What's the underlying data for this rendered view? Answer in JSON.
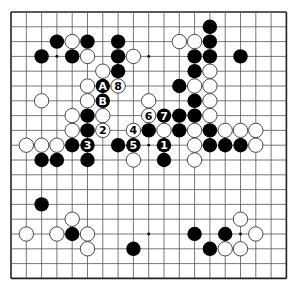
{
  "board": {
    "size": 19,
    "origin_x": 11,
    "origin_y": 12,
    "spacing_x": 15.3,
    "spacing_y": 14.8,
    "stone_radius": 7.2,
    "line_color": "#555555",
    "edge_color": "#222222",
    "background": "#ffffff",
    "black_color": "#000000",
    "white_fill": "#ffffff",
    "white_stroke": "#333333",
    "hoshi": [
      [
        3,
        3
      ],
      [
        9,
        3
      ],
      [
        15,
        3
      ],
      [
        3,
        9
      ],
      [
        9,
        9
      ],
      [
        15,
        9
      ],
      [
        3,
        15
      ],
      [
        9,
        15
      ],
      [
        15,
        15
      ]
    ]
  },
  "stones": [
    {
      "c": 13,
      "r": 1,
      "color": "black",
      "label": ""
    },
    {
      "c": 3,
      "r": 2,
      "color": "black",
      "label": ""
    },
    {
      "c": 4,
      "r": 2,
      "color": "white",
      "label": ""
    },
    {
      "c": 5,
      "r": 2,
      "color": "black",
      "label": ""
    },
    {
      "c": 7,
      "r": 2,
      "color": "black",
      "label": ""
    },
    {
      "c": 11,
      "r": 2,
      "color": "white",
      "label": ""
    },
    {
      "c": 12,
      "r": 2,
      "color": "white",
      "label": ""
    },
    {
      "c": 13,
      "r": 2,
      "color": "black",
      "label": ""
    },
    {
      "c": 2,
      "r": 3,
      "color": "black",
      "label": ""
    },
    {
      "c": 4,
      "r": 3,
      "color": "black",
      "label": ""
    },
    {
      "c": 5,
      "r": 3,
      "color": "white",
      "label": ""
    },
    {
      "c": 7,
      "r": 3,
      "color": "black",
      "label": ""
    },
    {
      "c": 8,
      "r": 3,
      "color": "white",
      "label": ""
    },
    {
      "c": 12,
      "r": 3,
      "color": "black",
      "label": ""
    },
    {
      "c": 13,
      "r": 3,
      "color": "black",
      "label": ""
    },
    {
      "c": 15,
      "r": 3,
      "color": "black",
      "label": ""
    },
    {
      "c": 6,
      "r": 4,
      "color": "white",
      "label": ""
    },
    {
      "c": 7,
      "r": 4,
      "color": "black",
      "label": ""
    },
    {
      "c": 12,
      "r": 4,
      "color": "black",
      "label": ""
    },
    {
      "c": 13,
      "r": 4,
      "color": "white",
      "label": ""
    },
    {
      "c": 5,
      "r": 5,
      "color": "white",
      "label": ""
    },
    {
      "c": 6,
      "r": 5,
      "color": "black",
      "label": "A"
    },
    {
      "c": 7,
      "r": 5,
      "color": "white",
      "label": "8"
    },
    {
      "c": 11,
      "r": 5,
      "color": "black",
      "label": ""
    },
    {
      "c": 12,
      "r": 5,
      "color": "white",
      "label": ""
    },
    {
      "c": 13,
      "r": 5,
      "color": "white",
      "label": ""
    },
    {
      "c": 2,
      "r": 6,
      "color": "white",
      "label": ""
    },
    {
      "c": 5,
      "r": 6,
      "color": "white",
      "label": ""
    },
    {
      "c": 6,
      "r": 6,
      "color": "black",
      "label": "B"
    },
    {
      "c": 9,
      "r": 6,
      "color": "white",
      "label": ""
    },
    {
      "c": 12,
      "r": 6,
      "color": "black",
      "label": ""
    },
    {
      "c": 13,
      "r": 6,
      "color": "white",
      "label": ""
    },
    {
      "c": 4,
      "r": 7,
      "color": "white",
      "label": ""
    },
    {
      "c": 5,
      "r": 7,
      "color": "black",
      "label": ""
    },
    {
      "c": 6,
      "r": 7,
      "color": "white",
      "label": ""
    },
    {
      "c": 9,
      "r": 7,
      "color": "white",
      "label": "6"
    },
    {
      "c": 10,
      "r": 7,
      "color": "black",
      "label": "7"
    },
    {
      "c": 11,
      "r": 7,
      "color": "black",
      "label": ""
    },
    {
      "c": 12,
      "r": 7,
      "color": "black",
      "label": ""
    },
    {
      "c": 13,
      "r": 7,
      "color": "white",
      "label": ""
    },
    {
      "c": 4,
      "r": 8,
      "color": "white",
      "label": ""
    },
    {
      "c": 5,
      "r": 8,
      "color": "black",
      "label": ""
    },
    {
      "c": 6,
      "r": 8,
      "color": "white",
      "label": "2"
    },
    {
      "c": 8,
      "r": 8,
      "color": "white",
      "label": "4"
    },
    {
      "c": 9,
      "r": 8,
      "color": "black",
      "label": ""
    },
    {
      "c": 10,
      "r": 8,
      "color": "white",
      "label": ""
    },
    {
      "c": 11,
      "r": 8,
      "color": "black",
      "label": ""
    },
    {
      "c": 12,
      "r": 8,
      "color": "white",
      "label": ""
    },
    {
      "c": 13,
      "r": 8,
      "color": "black",
      "label": ""
    },
    {
      "c": 14,
      "r": 8,
      "color": "white",
      "label": ""
    },
    {
      "c": 15,
      "r": 8,
      "color": "white",
      "label": ""
    },
    {
      "c": 16,
      "r": 8,
      "color": "white",
      "label": ""
    },
    {
      "c": 1,
      "r": 9,
      "color": "white",
      "label": ""
    },
    {
      "c": 2,
      "r": 9,
      "color": "white",
      "label": ""
    },
    {
      "c": 3,
      "r": 9,
      "color": "white",
      "label": ""
    },
    {
      "c": 4,
      "r": 9,
      "color": "black",
      "label": ""
    },
    {
      "c": 5,
      "r": 9,
      "color": "black",
      "label": "3"
    },
    {
      "c": 7,
      "r": 9,
      "color": "black",
      "label": ""
    },
    {
      "c": 8,
      "r": 9,
      "color": "black",
      "label": "5"
    },
    {
      "c": 10,
      "r": 9,
      "color": "black",
      "label": "1"
    },
    {
      "c": 12,
      "r": 9,
      "color": "white",
      "label": ""
    },
    {
      "c": 13,
      "r": 9,
      "color": "black",
      "label": ""
    },
    {
      "c": 14,
      "r": 9,
      "color": "black",
      "label": ""
    },
    {
      "c": 15,
      "r": 9,
      "color": "black",
      "label": ""
    },
    {
      "c": 16,
      "r": 9,
      "color": "white",
      "label": ""
    },
    {
      "c": 2,
      "r": 10,
      "color": "black",
      "label": ""
    },
    {
      "c": 3,
      "r": 10,
      "color": "black",
      "label": ""
    },
    {
      "c": 5,
      "r": 10,
      "color": "black",
      "label": ""
    },
    {
      "c": 8,
      "r": 10,
      "color": "white",
      "label": ""
    },
    {
      "c": 10,
      "r": 10,
      "color": "black",
      "label": ""
    },
    {
      "c": 12,
      "r": 10,
      "color": "white",
      "label": ""
    },
    {
      "c": 2,
      "r": 13,
      "color": "black",
      "label": ""
    },
    {
      "c": 4,
      "r": 14,
      "color": "white",
      "label": ""
    },
    {
      "c": 15,
      "r": 14,
      "color": "white",
      "label": ""
    },
    {
      "c": 1,
      "r": 15,
      "color": "white",
      "label": ""
    },
    {
      "c": 3,
      "r": 15,
      "color": "white",
      "label": ""
    },
    {
      "c": 4,
      "r": 15,
      "color": "black",
      "label": ""
    },
    {
      "c": 5,
      "r": 15,
      "color": "white",
      "label": ""
    },
    {
      "c": 12,
      "r": 15,
      "color": "black",
      "label": ""
    },
    {
      "c": 14,
      "r": 15,
      "color": "black",
      "label": ""
    },
    {
      "c": 16,
      "r": 15,
      "color": "white",
      "label": ""
    },
    {
      "c": 5,
      "r": 16,
      "color": "white",
      "label": ""
    },
    {
      "c": 8,
      "r": 16,
      "color": "black",
      "label": ""
    },
    {
      "c": 13,
      "r": 16,
      "color": "black",
      "label": ""
    },
    {
      "c": 14,
      "r": 16,
      "color": "white",
      "label": ""
    },
    {
      "c": 15,
      "r": 16,
      "color": "white",
      "label": ""
    }
  ]
}
